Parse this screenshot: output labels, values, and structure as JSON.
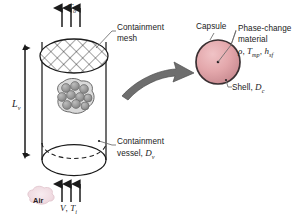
{
  "figure": {
    "background_color": "#ffffff",
    "line_color": "#1b1b1b",
    "arrow_color": "#6e6e6e",
    "capsule_fill": "#e3a7ab",
    "capsule_stroke": "#3a3032",
    "bed_sphere_fill": "#9b9b9b",
    "bed_blob_fill": "#d9d9d9",
    "air_tag_fill": "#f2dfe4"
  },
  "left_view": {
    "outlet_temperature": {
      "symbol": "T",
      "subscript": "o",
      "semantic": "outlet-air-temperature"
    },
    "containment_mesh_label": {
      "line1": "Containment",
      "line2": "mesh"
    },
    "containment_vessel_label": {
      "line1": "Containment",
      "line2_prefix": "vessel, ",
      "line2_symbol": "D",
      "line2_subscript": "v"
    },
    "vessel_length": {
      "symbol": "L",
      "subscript": "v",
      "semantic": "vessel-length-dimension"
    },
    "inlet_conditions": {
      "velocity_symbol": "V",
      "separator": ", ",
      "temperature_symbol": "T",
      "temperature_subscript": "i"
    },
    "air_tag": "Air",
    "inlet_arrow_count": 3,
    "outlet_arrow_count": 3
  },
  "right_view": {
    "capsule_label": "Capsule",
    "phase_change_material": {
      "line1": "Phase-change",
      "line2": "material",
      "properties": [
        {
          "symbol": "ρ",
          "subscript": ""
        },
        {
          "symbol": "T",
          "subscript": "mp"
        },
        {
          "symbol": "h",
          "subscript": "sf"
        }
      ],
      "properties_text": "ρ, T_mp, h_sf"
    },
    "shell_label": {
      "prefix": "Shell, ",
      "symbol": "D",
      "subscript": "c"
    }
  },
  "callout_arrow": {
    "semantic": "magnify-detail-arrow",
    "direction": "left-to-right"
  }
}
